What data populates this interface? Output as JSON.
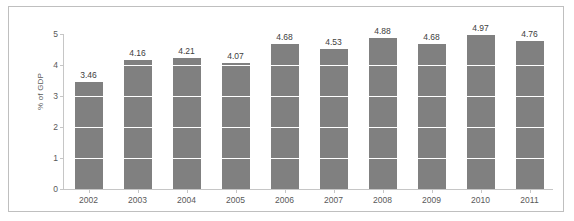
{
  "chart_data": {
    "type": "bar",
    "title": "",
    "subtitle": "",
    "xlabel": "",
    "ylabel": "% of GDP",
    "categories": [
      "2002",
      "2003",
      "2004",
      "2005",
      "2006",
      "2007",
      "2008",
      "2009",
      "2010",
      "2011"
    ],
    "values": [
      3.46,
      4.16,
      4.21,
      4.07,
      4.68,
      4.53,
      4.88,
      4.68,
      4.97,
      4.76
    ],
    "value_labels": [
      "3.46",
      "4.16",
      "4.21",
      "4.07",
      "4.68",
      "4.53",
      "4.88",
      "4.68",
      "4.97",
      "4.76"
    ],
    "series": [
      {
        "name": "% of GDP",
        "values": [
          3.46,
          4.16,
          4.21,
          4.07,
          4.68,
          4.53,
          4.88,
          4.68,
          4.97,
          4.76
        ]
      }
    ],
    "ylim": [
      0,
      5
    ],
    "y_ticks": [
      0,
      1,
      2,
      3,
      4,
      5
    ],
    "y_tick_labels": [
      "0",
      "1",
      "2",
      "3",
      "4",
      "5"
    ],
    "grid": true,
    "grid_orientation": "horizontal",
    "grid_color": "#ffffff",
    "legend": false,
    "legend_position": "none",
    "bar_color": "#808080",
    "axis_color": "#c6c6c6",
    "text_color": "#595959",
    "border_color": "#bfbfbf",
    "background": "#ffffff",
    "data_labels_shown": true
  }
}
